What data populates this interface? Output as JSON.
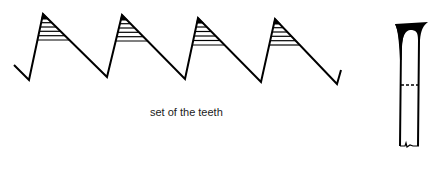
{
  "diagram": {
    "caption": "set of the teeth",
    "stroke_color": "#000000",
    "background": "#ffffff",
    "saw_teeth": {
      "count": 4,
      "path_points": [
        [
          14,
          65
        ],
        [
          29,
          80
        ],
        [
          43,
          14
        ],
        [
          107,
          77
        ],
        [
          122,
          15
        ],
        [
          185,
          79
        ],
        [
          198,
          18
        ],
        [
          261,
          82
        ],
        [
          275,
          19
        ],
        [
          337,
          84
        ],
        [
          341,
          70
        ]
      ],
      "hatched_regions": [
        {
          "apex": [
            43,
            14
          ],
          "hatch_bottom_y": 40
        },
        {
          "apex": [
            122,
            15
          ],
          "hatch_bottom_y": 41
        },
        {
          "apex": [
            198,
            18
          ],
          "hatch_bottom_y": 45
        },
        {
          "apex": [
            275,
            19
          ],
          "hatch_bottom_y": 45
        }
      ]
    },
    "blade_side_view": {
      "label": "",
      "top_y": 23,
      "bottom_y": 146,
      "left_x": 401,
      "right_x": 419,
      "dashed_line_y": 85
    }
  }
}
